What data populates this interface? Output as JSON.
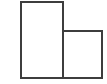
{
  "figure": {
    "name": "l-shape-composite-rectangles",
    "canvas": {
      "width": 107,
      "height": 84,
      "background_color": "#ffffff"
    },
    "style": {
      "stroke_color": "#3d3d3d",
      "stroke_width": 2,
      "fill_color": "#ffffff"
    },
    "shapes": [
      {
        "id": "tall-rectangle",
        "label": "tall left rectangle",
        "x": 21,
        "y": 2,
        "width": 42,
        "height": 76
      },
      {
        "id": "short-rectangle",
        "label": "short right rectangle",
        "x": 63,
        "y": 31,
        "width": 39,
        "height": 47
      }
    ],
    "divider": {
      "id": "shared-vertical-edge",
      "label": "shared vertical dividing segment",
      "x1": 63,
      "y1": 31,
      "x2": 63,
      "y2": 78
    },
    "labels": []
  }
}
